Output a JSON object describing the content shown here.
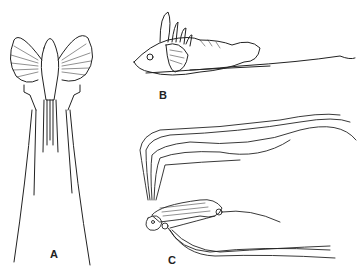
{
  "figure": {
    "type": "scientific line illustration",
    "panels": [
      {
        "label": "A",
        "view": "ventral view of fish head with pectoral fins and elongated filaments"
      },
      {
        "label": "B",
        "view": "lateral view of juvenile fish with long trailing pelvic filament"
      },
      {
        "label": "C",
        "view": "larval fish with very long trailing fin-ray filaments"
      }
    ]
  },
  "colors": {
    "ink": "#222222",
    "background": "#ffffff"
  }
}
